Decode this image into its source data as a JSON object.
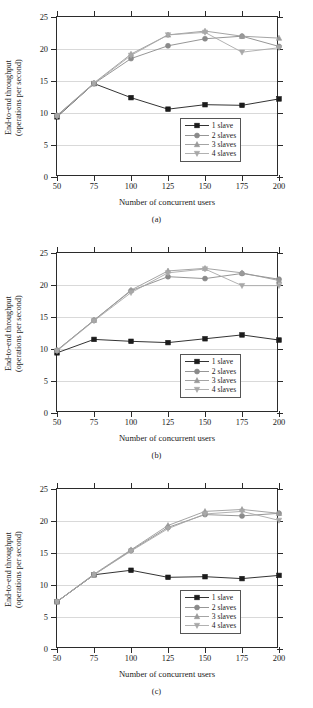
{
  "figure": {
    "axis": {
      "ylabel_line1": "End-to-end throughput",
      "ylabel_line2": "(operations per second)",
      "xlabel": "Number of concurrent users",
      "yticks": [
        "0",
        "5",
        "10",
        "15",
        "20",
        "25"
      ],
      "xticks": [
        "50",
        "75",
        "100",
        "125",
        "150",
        "175",
        "200"
      ]
    },
    "legend": {
      "items": [
        {
          "label": "1 slave",
          "marker": "square-marker",
          "color": "#1c1c1c"
        },
        {
          "label": "2 slaves",
          "marker": "circle-marker",
          "color": "#8a8a8a"
        },
        {
          "label": "3 slaves",
          "marker": "triangle-up-marker",
          "color": "#9a9a9a"
        },
        {
          "label": "4 slaves",
          "marker": "triangle-down-marker",
          "color": "#a8a8a8"
        }
      ]
    },
    "captions": [
      "(a)",
      "(b)",
      "(c)"
    ]
  },
  "chart_data": [
    {
      "type": "line",
      "title": "(a)",
      "xlabel": "Number of concurrent users",
      "ylabel": "End-to-end throughput (operations per second)",
      "x": [
        50,
        75,
        100,
        125,
        150,
        175,
        200
      ],
      "xlim": [
        50,
        200
      ],
      "ylim": [
        0,
        25
      ],
      "grid": "horizontal",
      "legend_position": "lower-right",
      "series": [
        {
          "name": "1 slave",
          "values": [
            9.4,
            14.6,
            12.4,
            10.6,
            11.3,
            11.2,
            12.2
          ]
        },
        {
          "name": "2 slaves",
          "values": [
            9.6,
            14.6,
            18.5,
            20.5,
            21.6,
            22.0,
            20.4
          ]
        },
        {
          "name": "3 slaves",
          "values": [
            9.6,
            14.7,
            19.2,
            22.2,
            22.8,
            22.0,
            21.7
          ]
        },
        {
          "name": "4 slaves",
          "values": [
            9.5,
            14.6,
            19.0,
            22.2,
            22.6,
            19.5,
            20.2
          ]
        }
      ]
    },
    {
      "type": "line",
      "title": "(b)",
      "xlabel": "Number of concurrent users",
      "ylabel": "End-to-end throughput (operations per second)",
      "x": [
        50,
        75,
        100,
        125,
        150,
        175,
        200
      ],
      "xlim": [
        50,
        200
      ],
      "ylim": [
        0,
        25
      ],
      "grid": "horizontal",
      "legend_position": "lower-right",
      "series": [
        {
          "name": "1 slave",
          "values": [
            9.4,
            11.5,
            11.2,
            11.0,
            11.6,
            12.2,
            11.4
          ]
        },
        {
          "name": "2 slaves",
          "values": [
            9.8,
            14.5,
            19.1,
            21.3,
            21.0,
            21.8,
            20.9
          ]
        },
        {
          "name": "3 slaves",
          "values": [
            9.8,
            14.5,
            19.2,
            22.2,
            22.6,
            21.9,
            20.7
          ]
        },
        {
          "name": "4 slaves",
          "values": [
            9.7,
            14.4,
            18.8,
            21.9,
            22.5,
            19.9,
            19.9
          ]
        }
      ]
    },
    {
      "type": "line",
      "title": "(c)",
      "xlabel": "Number of concurrent users",
      "ylabel": "End-to-end throughput (operations per second)",
      "x": [
        50,
        75,
        100,
        125,
        150,
        175,
        200
      ],
      "xlim": [
        50,
        200
      ],
      "ylim": [
        0,
        25
      ],
      "grid": "horizontal",
      "legend_position": "lower-right",
      "series": [
        {
          "name": "1 slave",
          "values": [
            7.4,
            11.6,
            12.3,
            11.2,
            11.3,
            11.0,
            11.5
          ]
        },
        {
          "name": "2 slaves",
          "values": [
            7.4,
            11.6,
            15.4,
            19.0,
            21.0,
            20.8,
            21.2
          ]
        },
        {
          "name": "3 slaves",
          "values": [
            7.4,
            11.7,
            15.5,
            19.3,
            21.5,
            21.8,
            21.2
          ]
        },
        {
          "name": "4 slaves",
          "values": [
            7.4,
            11.6,
            15.3,
            18.8,
            21.1,
            21.5,
            20.1
          ]
        }
      ]
    }
  ]
}
